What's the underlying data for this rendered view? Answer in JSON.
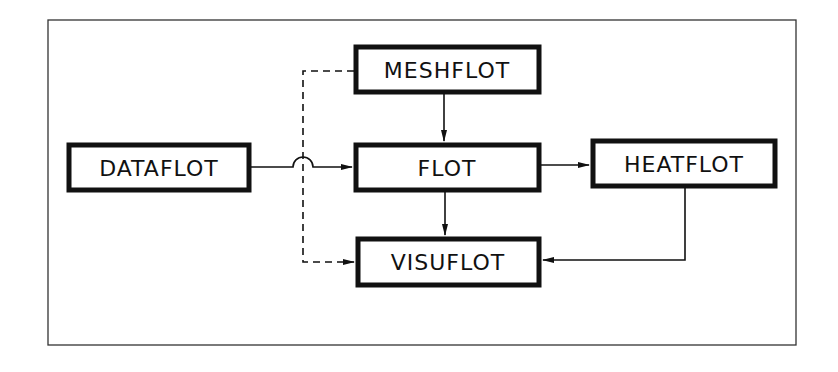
{
  "diagram": {
    "colors": {
      "line": "#111111",
      "background": "#ffffff",
      "frame": "#333333"
    },
    "frame": {
      "x": 48,
      "y": 20,
      "w": 748,
      "h": 325
    },
    "nodes": [
      {
        "id": "dataflot",
        "label": "DATAFLOT",
        "x": 67,
        "y": 143,
        "w": 184,
        "h": 49
      },
      {
        "id": "meshflot",
        "label": "MESHFLOT",
        "x": 354,
        "y": 45,
        "w": 187,
        "h": 49
      },
      {
        "id": "flot",
        "label": "FLOT",
        "x": 354,
        "y": 143,
        "w": 187,
        "h": 49
      },
      {
        "id": "heatflot",
        "label": "HEATFLOT",
        "x": 591,
        "y": 139,
        "w": 186,
        "h": 49
      },
      {
        "id": "visuflot",
        "label": "VISUFLOT",
        "x": 356,
        "y": 237,
        "w": 185,
        "h": 50
      }
    ],
    "edges": [
      {
        "from": "dataflot",
        "to": "flot",
        "style": "solid",
        "note": "line hops over dashed line"
      },
      {
        "from": "meshflot",
        "to": "flot",
        "style": "solid"
      },
      {
        "from": "flot",
        "to": "heatflot",
        "style": "solid"
      },
      {
        "from": "flot",
        "to": "visuflot",
        "style": "solid"
      },
      {
        "from": "heatflot",
        "to": "visuflot",
        "style": "solid"
      },
      {
        "from": "meshflot",
        "to": "visuflot",
        "style": "dashed"
      }
    ]
  }
}
